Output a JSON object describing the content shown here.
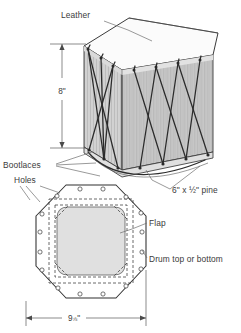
{
  "figure": {
    "labels": {
      "leather": "Leather",
      "height_dim": "8\"",
      "bootlaces": "Bootlaces",
      "pine": "6\" x ½\" pine",
      "holes": "Holes",
      "flap": "Flap",
      "drum_top_or_bottom": "Drum top or bottom",
      "width_dim_whole": "9",
      "width_dim_fraction": "⅞",
      "width_dim_unit": "\""
    },
    "views": {
      "perspective": {
        "name": "drum-perspective-view",
        "parts": [
          "leather head",
          "pine staves",
          "bootlace lacing"
        ]
      },
      "plan": {
        "name": "drum-head-plan-view",
        "shape": "octagon",
        "hole_count": 16,
        "features": [
          "flap",
          "stitch square",
          "lacing holes"
        ]
      }
    },
    "colors": {
      "paper": "#ffffff",
      "body_fill": "#e8e8e8",
      "head_fill": "#fcfcfc",
      "shade_fill": "#d2d2d2",
      "ink": "#2e2e2e",
      "label_ink": "#3b3b3b",
      "leader": "#6e6e6e"
    }
  }
}
